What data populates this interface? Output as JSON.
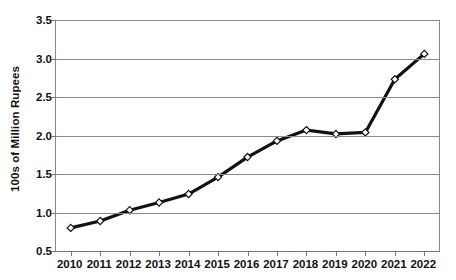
{
  "chart_data": {
    "type": "line",
    "title": "",
    "subtitle": "",
    "xlabel": "",
    "ylabel": "100s of Million Rupees",
    "categories": [
      "2010",
      "2011",
      "2012",
      "2013",
      "2014",
      "2015",
      "2016",
      "2017",
      "2018",
      "2019",
      "2020",
      "2021",
      "2022"
    ],
    "values": [
      0.8,
      0.89,
      1.03,
      1.13,
      1.24,
      1.46,
      1.72,
      1.93,
      2.07,
      2.02,
      2.04,
      2.73,
      3.06
    ],
    "ylim": [
      0.5,
      3.5
    ],
    "y_ticks": [
      "0.5",
      "1.0",
      "1.5",
      "2.0",
      "2.5",
      "3.0",
      "3.5"
    ],
    "y_tick_values": [
      0.5,
      1.0,
      1.5,
      2.0,
      2.5,
      3.0,
      3.5
    ],
    "grid": true,
    "legend": false,
    "legend_position": "none",
    "series_color": "#111111",
    "marker_fill": "#ffffff",
    "marker_edge": "#111111",
    "gridline_color": "#8a8a8a",
    "axis_color": "#777777",
    "marker": "diamond"
  }
}
